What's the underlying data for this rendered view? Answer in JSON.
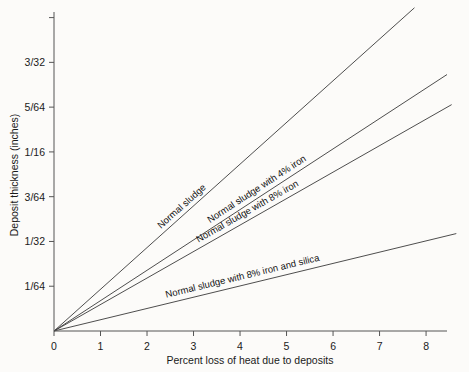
{
  "chart_data": {
    "type": "line",
    "title": "",
    "xlabel": "Percent loss of heat due to deposits",
    "ylabel": "Deposit thickness (inches)",
    "xlim": [
      0,
      8.45
    ],
    "ylim": [
      0,
      0.111328125
    ],
    "grid": false,
    "legend_position": "inline-along-lines",
    "x_ticks": [
      {
        "value": 0,
        "label": "0"
      },
      {
        "value": 1,
        "label": "1"
      },
      {
        "value": 2,
        "label": "2"
      },
      {
        "value": 3,
        "label": "3"
      },
      {
        "value": 4,
        "label": "4"
      },
      {
        "value": 5,
        "label": "5"
      },
      {
        "value": 6,
        "label": "6"
      },
      {
        "value": 7,
        "label": "7"
      },
      {
        "value": 8,
        "label": "8"
      }
    ],
    "y_ticks": [
      {
        "value": 0.015625,
        "label": "1/64"
      },
      {
        "value": 0.03125,
        "label": "1/32"
      },
      {
        "value": 0.046875,
        "label": "3/64"
      },
      {
        "value": 0.0625,
        "label": "1/16"
      },
      {
        "value": 0.078125,
        "label": "5/64"
      },
      {
        "value": 0.09375,
        "label": "3/32"
      },
      {
        "value": 0.109375,
        "label": ""
      }
    ],
    "series": [
      {
        "name": "Normal sludge",
        "label": "Normal sludge",
        "color": "#3a3a3a",
        "x": [
          0,
          7.75
        ],
        "y": [
          0,
          0.1128
        ]
      },
      {
        "name": "Normal sludge with 4% iron",
        "label": "Normal sludge with 4% iron",
        "color": "#3a3a3a",
        "x": [
          0,
          8.45
        ],
        "y": [
          0,
          0.0895
        ]
      },
      {
        "name": "Normal sludge with 8% iron",
        "label": "Normal sludge with 8% iron",
        "color": "#3a3a3a",
        "x": [
          0,
          8.55
        ],
        "y": [
          0,
          0.079
        ]
      },
      {
        "name": "Normal sludge with 8% iron and silica",
        "label": "Normal sludge with 8% iron and silica",
        "color": "#3a3a3a",
        "x": [
          0,
          8.65
        ],
        "y": [
          0,
          0.034
        ]
      }
    ]
  }
}
